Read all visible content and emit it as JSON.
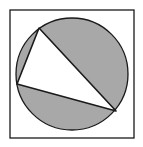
{
  "diagram": {
    "colors": {
      "background": "#ffffff",
      "shade": "#a8a8a8",
      "stroke": "#1a1a1a"
    },
    "square": {
      "x": 10,
      "y": 10,
      "width": 124,
      "height": 128
    },
    "circle": {
      "cx": 72,
      "cy": 74,
      "r": 56
    },
    "triangle": {
      "points": "39,28 17,84 116,111"
    }
  }
}
